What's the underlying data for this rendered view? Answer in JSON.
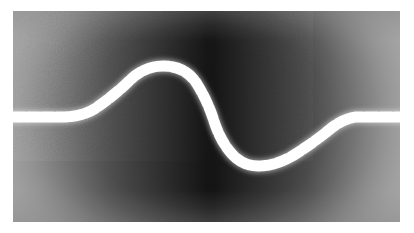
{
  "figure": {
    "kind": "grayscale-micrograph",
    "page_background": "#ffffff",
    "plate": {
      "x": 13,
      "y": 11,
      "width": 387,
      "height": 211
    },
    "background": {
      "margin_gray": "#8f8f8f",
      "blob_dark": "#101010",
      "edge_light_left": "#a5a5a5",
      "edge_light_right": "#a8a8a8",
      "blob_center_x_pct": 50,
      "blob_center_y_pct": 50,
      "blob_radius_x_pct": 58,
      "blob_radius_y_pct": 78,
      "grain_opacity": 0.2
    },
    "trace": {
      "name": "dashed-sinusoid",
      "color": "#ffffff",
      "glow_color": "#e8e8e8",
      "thickness_px": 11,
      "dash_length_px": 11.5,
      "gap_length_px": 3.0,
      "baseline_y": 116,
      "peak_y": 68,
      "trough_y": 164,
      "left_flat_end_x": 78,
      "right_flat_start_x": 348,
      "peak_x": 150,
      "zero_cross_x": 212,
      "trough_x": 252,
      "path": "M 13 117 L 62 117 Q 82 117 96 108 Q 116 94 130 80 Q 145 66 163 66 Q 186 66 197 84 Q 207 100 213 118 Q 220 141 232 154 Q 243 166 258 166 Q 276 166 294 155 Q 313 143 329 130 Q 342 119 356 117 L 401 117"
    }
  }
}
